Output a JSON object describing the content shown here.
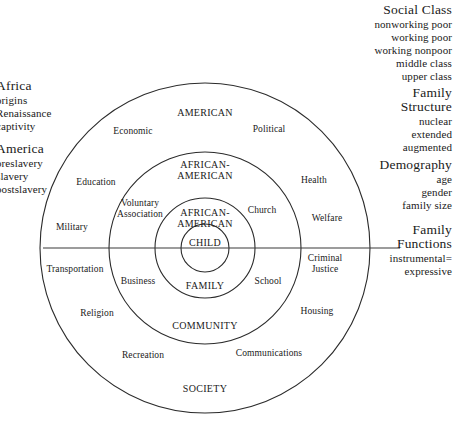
{
  "diagram": {
    "rings": [
      {
        "id": "outer",
        "top_label": "AMERICAN",
        "bottom_label": "SOCIETY"
      },
      {
        "id": "ring3",
        "top_label": "AFRICAN-AMERICAN",
        "bottom_label": "COMMUNITY"
      },
      {
        "id": "ring2",
        "top_label": "AFRICAN-AMERICAN",
        "bottom_label": "FAMILY"
      },
      {
        "id": "core",
        "top_label": "CHILD",
        "bottom_label": ""
      }
    ],
    "ring_labels": {
      "outer_top": "AMERICAN",
      "outer_bottom": "SOCIETY",
      "third_top_line1": "AFRICAN-",
      "third_top_line2": "AMERICAN",
      "third_bottom": "COMMUNITY",
      "second_top_line1": "AFRICAN-",
      "second_top_line2": "AMERICAN",
      "second_bottom": "FAMILY",
      "core": "CHILD"
    },
    "institutions": [
      {
        "name": "Economic",
        "line1": "Economic",
        "line2": ""
      },
      {
        "name": "Political",
        "line1": "Political",
        "line2": ""
      },
      {
        "name": "Education",
        "line1": "Education",
        "line2": ""
      },
      {
        "name": "Health",
        "line1": "Health",
        "line2": ""
      },
      {
        "name": "Voluntary Association",
        "line1": "Voluntary",
        "line2": "Association"
      },
      {
        "name": "Church",
        "line1": "Church",
        "line2": ""
      },
      {
        "name": "Welfare",
        "line1": "Welfare",
        "line2": ""
      },
      {
        "name": "Military",
        "line1": "Military",
        "line2": ""
      },
      {
        "name": "Transportation",
        "line1": "Transportation",
        "line2": ""
      },
      {
        "name": "Business",
        "line1": "Business",
        "line2": ""
      },
      {
        "name": "School",
        "line1": "School",
        "line2": ""
      },
      {
        "name": "Criminal Justice",
        "line1": "Criminal",
        "line2": "Justice"
      },
      {
        "name": "Religion",
        "line1": "Religion",
        "line2": ""
      },
      {
        "name": "Housing",
        "line1": "Housing",
        "line2": ""
      },
      {
        "name": "Recreation",
        "line1": "Recreation",
        "line2": ""
      },
      {
        "name": "Communications",
        "line1": "Communications",
        "line2": ""
      }
    ],
    "geometry": {
      "center_x": 205,
      "center_y": 248,
      "radii": [
        165,
        96,
        50,
        24
      ],
      "axis_line_y": 248,
      "axis_line_x1": 43,
      "axis_line_x2": 400
    },
    "colors": {
      "background": "#ffffff",
      "stroke": "#2b2b2b",
      "text": "#1a1a1a"
    }
  },
  "margins": {
    "left_top": {
      "heading": "Africa",
      "items": [
        "origins",
        "Renaissance",
        "captivity"
      ]
    },
    "left_bottom": {
      "heading": "America",
      "items": [
        "preslavery",
        "slavery",
        "postslavery"
      ]
    },
    "right_1": {
      "heading_line1": "Social Class",
      "heading_line2": "",
      "items": [
        "nonworking poor",
        "working poor",
        "working nonpoor",
        "middle class",
        "upper class"
      ]
    },
    "right_2": {
      "heading_line1": "Family",
      "heading_line2": "Structure",
      "items": [
        "nuclear",
        "extended",
        "augmented"
      ]
    },
    "right_3": {
      "heading_line1": "Demography",
      "heading_line2": "",
      "items": [
        "age",
        "gender",
        "family size"
      ]
    },
    "right_4": {
      "heading_line1": "Family",
      "heading_line2": "Functions",
      "items": [
        "instrumental=",
        "expressive"
      ]
    }
  }
}
